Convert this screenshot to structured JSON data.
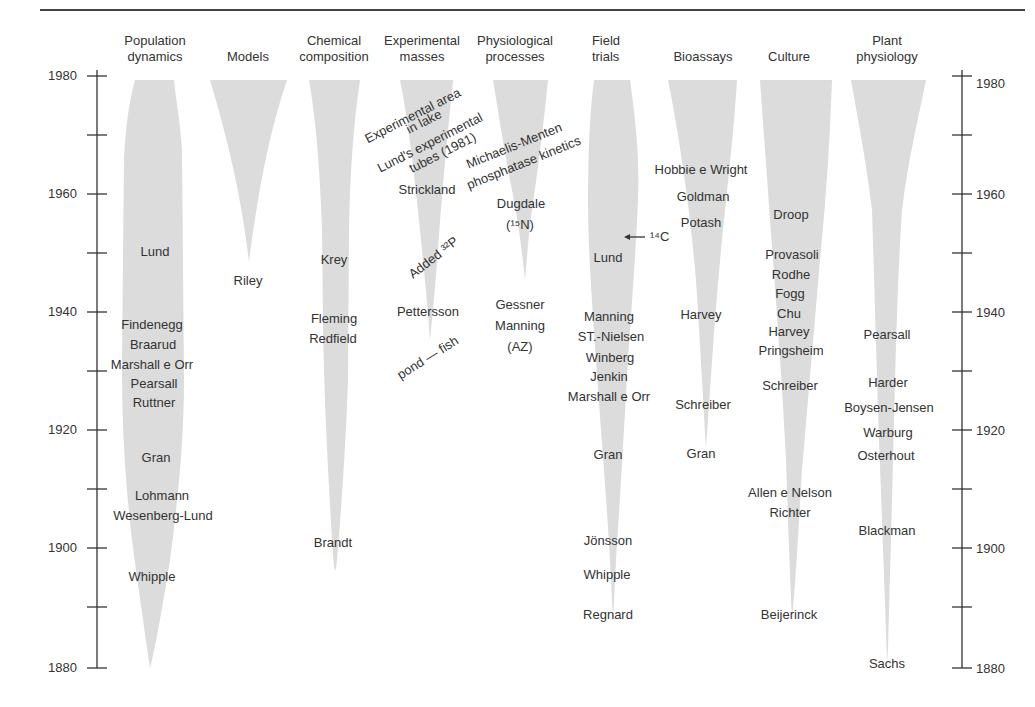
{
  "figure": {
    "y_axis": {
      "range": [
        1880,
        1980
      ],
      "labeled_ticks": [
        "1980",
        "1960",
        "1940",
        "1920",
        "1900",
        "1880"
      ],
      "minor_tick_interval": 10
    },
    "columns": [
      {
        "id": "population",
        "header_line1": "Population",
        "header_line2": "dynamics",
        "entries": [
          {
            "text": "Lund",
            "year": 1950
          },
          {
            "text": "Findenegg",
            "year": 1938
          },
          {
            "text": "Braarud",
            "year": 1935
          },
          {
            "text": "Marshall e Orr",
            "year": 1932
          },
          {
            "text": "Pearsall",
            "year": 1929
          },
          {
            "text": "Ruttner",
            "year": 1926
          },
          {
            "text": "Gran",
            "year": 1918
          },
          {
            "text": "Lohmann",
            "year": 1909
          },
          {
            "text": "Wesenberg-Lund",
            "year": 1906
          },
          {
            "text": "Whipple",
            "year": 1895
          }
        ]
      },
      {
        "id": "models",
        "header_line1": "",
        "header_line2": "Models",
        "entries": [
          {
            "text": "Riley",
            "year": 1945
          }
        ]
      },
      {
        "id": "chemical",
        "header_line1": "Chemical",
        "header_line2": "composition",
        "entries": [
          {
            "text": "Krey",
            "year": 1949
          },
          {
            "text": "Fleming",
            "year": 1939
          },
          {
            "text": "Redfield",
            "year": 1936
          },
          {
            "text": "Brandt",
            "year": 1901
          }
        ]
      },
      {
        "id": "experimental",
        "header_line1": "Experimental",
        "header_line2": "masses",
        "entries": [
          {
            "text": "Experimental area",
            "year": 1976,
            "rotated": true
          },
          {
            "text": "in lake",
            "year": 1974,
            "rotated": true
          },
          {
            "text": "Lund's experimental",
            "year": 1970,
            "rotated": true
          },
          {
            "text": "tubes (1981)",
            "year": 1968,
            "rotated": true
          },
          {
            "text": "Strickland",
            "year": 1961
          },
          {
            "text": "Added ³²P",
            "year": 1948,
            "rotated": true
          },
          {
            "text": "Pettersson",
            "year": 1940
          },
          {
            "text": "pond — fish",
            "year": 1933,
            "rotated": true
          }
        ]
      },
      {
        "id": "physiological",
        "header_line1": "Physiological",
        "header_line2": "processes",
        "entries": [
          {
            "text": "Michaelis-Menten",
            "year": 1969,
            "rotated": true
          },
          {
            "text": "phosphatase kinetics",
            "year": 1966,
            "rotated": true
          },
          {
            "text": "Dugdale",
            "year": 1958
          },
          {
            "text": "(¹⁵N)",
            "year": 1955
          },
          {
            "text": "Gessner",
            "year": 1940
          },
          {
            "text": "Manning",
            "year": 1937
          },
          {
            "text": "(AZ)",
            "year": 1934
          }
        ]
      },
      {
        "id": "field",
        "header_line1": "Field",
        "header_line2": "trials",
        "annotation": "← ¹⁴C",
        "entries": [
          {
            "text": "Lund",
            "year": 1950
          },
          {
            "text": "Manning",
            "year": 1939
          },
          {
            "text": "ST.-Nielsen",
            "year": 1936
          },
          {
            "text": "Winberg",
            "year": 1933
          },
          {
            "text": "Jenkin",
            "year": 1930
          },
          {
            "text": "Marshall e Orr",
            "year": 1927
          },
          {
            "text": "Gran",
            "year": 1918
          },
          {
            "text": "Jönsson",
            "year": 1901
          },
          {
            "text": "Whipple",
            "year": 1895
          },
          {
            "text": "Regnard",
            "year": 1889
          }
        ]
      },
      {
        "id": "bioassays",
        "header_line1": "",
        "header_line2": "Bioassays",
        "entries": [
          {
            "text": "Hobbie e Wright",
            "year": 1965
          },
          {
            "text": "Goldman",
            "year": 1961
          },
          {
            "text": "Potash",
            "year": 1957
          },
          {
            "text": "Harvey",
            "year": 1939
          },
          {
            "text": "Schreiber",
            "year": 1926
          },
          {
            "text": "Gran",
            "year": 1918
          }
        ]
      },
      {
        "id": "culture",
        "header_line1": "",
        "header_line2": "Culture",
        "entries": [
          {
            "text": "Droop",
            "year": 1957
          },
          {
            "text": "Provasoli",
            "year": 1950
          },
          {
            "text": "Rodhe",
            "year": 1947
          },
          {
            "text": "Fogg",
            "year": 1944
          },
          {
            "text": "Chu",
            "year": 1941
          },
          {
            "text": "Harvey",
            "year": 1938
          },
          {
            "text": "Pringsheim",
            "year": 1935
          },
          {
            "text": "Schreiber",
            "year": 1930
          },
          {
            "text": "Allen e Nelson",
            "year": 1910
          },
          {
            "text": "Richter",
            "year": 1907
          },
          {
            "text": "Beijerinck",
            "year": 1889
          }
        ]
      },
      {
        "id": "plant",
        "header_line1": "Plant",
        "header_line2": "physiology",
        "entries": [
          {
            "text": "Pearsall",
            "year": 1937
          },
          {
            "text": "Harder",
            "year": 1930
          },
          {
            "text": "Boysen-Jensen",
            "year": 1926
          },
          {
            "text": "Warburg",
            "year": 1922
          },
          {
            "text": "Osterhout",
            "year": 1918
          },
          {
            "text": "Blackman",
            "year": 1903
          },
          {
            "text": "Sachs",
            "year": 1881
          }
        ]
      }
    ]
  }
}
